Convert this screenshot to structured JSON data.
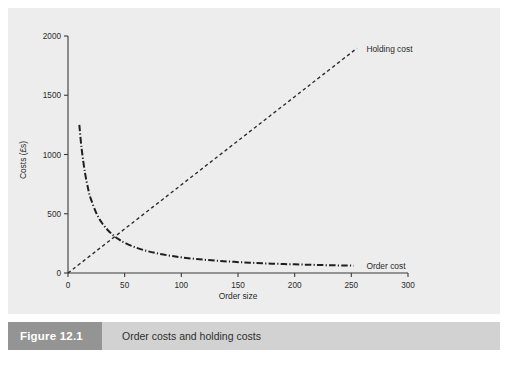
{
  "figure": {
    "number_label": "Figure 12.1",
    "caption": "Order costs and holding costs",
    "number_box_color": "#949494",
    "caption_bar_color": "#d2d2d2",
    "panel_color": "#ededed"
  },
  "chart_data": {
    "type": "line",
    "title": "",
    "xlabel": "Order size",
    "ylabel": "Costs (£s)",
    "xlim": [
      0,
      300
    ],
    "ylim": [
      0,
      2000
    ],
    "xticks": [
      "0",
      "50",
      "100",
      "150",
      "200",
      "250",
      "300"
    ],
    "xtick_values": [
      0,
      50,
      100,
      150,
      200,
      250,
      300
    ],
    "yticks": [
      "0",
      "500",
      "1000",
      "1500",
      "2000"
    ],
    "ytick_values": [
      0,
      500,
      1000,
      1500,
      2000
    ],
    "grid": false,
    "legend_position": "inline-annotation",
    "series": [
      {
        "name": "Holding cost",
        "style": "dashed",
        "label_x": 258,
        "label_y": 1890,
        "x": [
          0,
          25,
          50,
          75,
          100,
          125,
          150,
          175,
          200,
          225,
          255
        ],
        "values": [
          0,
          186,
          372,
          558,
          744,
          930,
          1116,
          1302,
          1488,
          1674,
          1897
        ]
      },
      {
        "name": "Order cost",
        "style": "dash-dot",
        "label_x": 258,
        "label_y": 60,
        "x": [
          10,
          12,
          15,
          18,
          20,
          25,
          30,
          35,
          40,
          45,
          50,
          60,
          70,
          80,
          90,
          100,
          120,
          140,
          160,
          180,
          200,
          220,
          240,
          252
        ],
        "values": [
          1250,
          1050,
          845,
          700,
          630,
          505,
          422,
          363,
          318,
          283,
          255,
          214,
          185,
          163,
          146,
          132,
          112,
          98,
          87,
          79,
          73,
          68,
          64,
          62
        ]
      }
    ]
  }
}
